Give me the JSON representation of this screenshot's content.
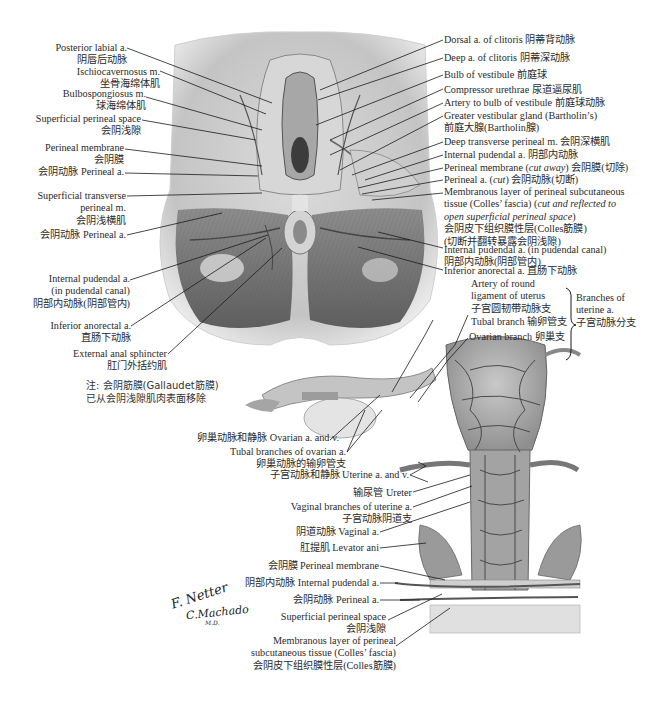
{
  "figure": {
    "colors": {
      "background": "#ffffff",
      "text": "#2a2a2a",
      "leader": "#1a1a1a",
      "tissue_light": "#e6e6e6",
      "tissue_mid": "#b5b5b5",
      "tissue_dark": "#6e6e6e",
      "vessel": "#4a4a4a"
    },
    "top_panel": {
      "left_labels": [
        {
          "en": "Posterior labial a.",
          "zh": "阴唇后动脉"
        },
        {
          "en": "Ischiocavernosus m.",
          "zh": "坐骨海绵体肌"
        },
        {
          "en": "Bulbospongiosus m.",
          "zh": "球海绵体肌"
        },
        {
          "en": "Superficial perineal space",
          "zh": "会阴浅隙"
        },
        {
          "en": "Perineal membrane",
          "zh": "会阴膜"
        },
        {
          "en": "会阴动脉 Perineal a."
        },
        {
          "en": "Superficial transverse",
          "en2": "perineal m.",
          "zh": "会阴浅横肌"
        },
        {
          "en": "会阴动脉 Perineal a."
        },
        {
          "en": "Internal pudendal a.",
          "en2": "(in pudendal canal)",
          "zh": "阴部内动脉(阴部管内)"
        },
        {
          "en": "Inferior anorectal a.",
          "zh": "直肠下动脉"
        },
        {
          "en": "External anal sphincter",
          "zh": "肛门外括约肌"
        }
      ],
      "note": {
        "line1": "注: 会阴筋膜(Gallaudet筋膜)",
        "line2": "已从会阴浅隙肌肉表面移除"
      },
      "right_labels": [
        {
          "text": "Dorsal a. of clitoris 阴蒂背动脉"
        },
        {
          "text": "Deep a. of clitoris 阴蒂深动脉"
        },
        {
          "text": "Bulb of vestibule 前庭球"
        },
        {
          "text": "Compressor urethrae 尿道逼尿肌"
        },
        {
          "text": "Artery to bulb of vestibule 前庭球动脉"
        },
        {
          "text": "Greater vestibular gland (Bartholin’s)",
          "zh": "前庭大腺(Bartholin腺)"
        },
        {
          "text": "Deep transverse perineal m. 会阴深横肌"
        },
        {
          "text": "Internal pudendal a. 阴部内动脉"
        },
        {
          "text_a": "Perineal membrane (",
          "italic": "cut away",
          "text_b": ") 会阴膜(切除)"
        },
        {
          "text_a": "Perineal a. (",
          "italic": "cut",
          "text_b": ") 会阴动脉(切断)"
        },
        {
          "line1": "Membranous layer of perineal subcutaneous",
          "line2a": "tissue (Colles’ fascia) (",
          "line2i": "cut and reflected to",
          "line3i": "open superficial perineal space",
          "line3b": ")",
          "zh1": "会阴皮下组织膜性层(Colles筋膜)",
          "zh2": "(切断并翻转暴露会阴浅隙)"
        },
        {
          "text": "Internal pudendal a. (in pudendal canal)",
          "zh": "阴部内动脉(阴部管内)"
        },
        {
          "text": "Inferior anorectal a. 直肠下动脉"
        }
      ]
    },
    "bottom_panel": {
      "uterine_branches": {
        "items": [
          {
            "line1": "Artery of round",
            "line2": "ligament of uterus",
            "zh": "子宫圆韧带动脉支"
          },
          {
            "text": "Tubal branch 输卵管支"
          },
          {
            "text": "Ovarian branch 卵巢支"
          }
        ],
        "group_label": {
          "line1": "Branches of",
          "line2": "uterine a.",
          "zh": "子宫动脉分支"
        }
      },
      "left_labels": [
        {
          "text": "卵巢动脉和静脉 Ovarian a. and v."
        },
        {
          "text": "Tubal branches of ovarian a.",
          "zh": "卵巢动脉的输卵管支"
        },
        {
          "text": "子宫动脉和静脉 Uterine a. and v."
        },
        {
          "text": "输尿管 Ureter"
        },
        {
          "text": "Vaginal branches of uterine a.",
          "zh": "子宫动脉阴道支"
        },
        {
          "text": "阴道动脉 Vaginal a."
        },
        {
          "text": "肛提肌 Levator ani"
        },
        {
          "text": "会阴膜 Perineal membrane"
        },
        {
          "text": "阴部内动脉 Internal pudendal a."
        },
        {
          "text": "会阴动脉 Perineal a."
        },
        {
          "text": "Superficial perineal space",
          "zh": "会阴浅隙"
        },
        {
          "line1": "Membranous layer of perineal",
          "line2": "subcutaneous tissue (Colles’ fascia)",
          "zh": "会阴皮下组织膜性层(Colles筋膜)"
        }
      ]
    },
    "signatures": {
      "netter": "F. Netter",
      "machado": "C.Machado",
      "md": "M.D."
    }
  }
}
